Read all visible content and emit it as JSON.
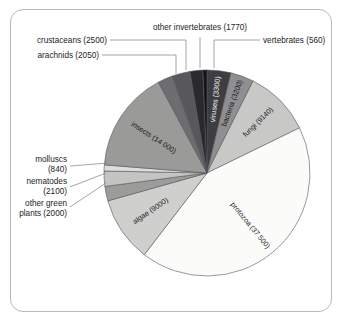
{
  "figure": {
    "frame_border_color": "#b9b9b9",
    "background_color": "#ffffff"
  },
  "chart_data": {
    "type": "pie",
    "title": "",
    "units": "number of described species",
    "total": 87960,
    "center": {
      "x": 207,
      "y": 173
    },
    "radius": 103,
    "start_angle_deg": -90,
    "direction": "clockwise",
    "legend": "none",
    "labels": [
      "viruses (3300)",
      "bacteria (3200)",
      "fungi (9140)",
      "protozoa (37 500)",
      "algae (9000)",
      "other green plants (2000)",
      "nematodes (2100)",
      "molluscs (840)",
      "insects (14 000)",
      "arachnids (2050)",
      "crustaceans (2500)",
      "other invertebrates (1770)",
      "vertebrates (560)"
    ],
    "categories": [
      "viruses",
      "bacteria",
      "fungi",
      "protozoa",
      "algae",
      "other green plants",
      "nematodes",
      "molluscs",
      "insects",
      "arachnids",
      "crustaceans",
      "other invertebrates",
      "vertebrates"
    ],
    "values": [
      3300,
      3200,
      9140,
      37500,
      9000,
      2000,
      2100,
      840,
      14000,
      2050,
      2500,
      1770,
      560
    ],
    "colors": [
      "#3e3e42",
      "#8f8f92",
      "#c8c8c6",
      "#fbfbf9",
      "#cfcfcd",
      "#9c9c9b",
      "#c4c4c2",
      "#dcdcda",
      "#9a9a99",
      "#6d6d70",
      "#58585c",
      "#2a2a2e",
      "#141416"
    ],
    "label_placement": [
      "inside",
      "inside",
      "inside",
      "inside",
      "inside",
      "callout-left",
      "callout-left",
      "callout-left",
      "inside",
      "callout-topleft",
      "callout-topleft",
      "callout-top",
      "callout-topright"
    ]
  },
  "callouts": {
    "other_invertebrates": "other invertebrates (1770)",
    "vertebrates": "vertebrates (560)",
    "crustaceans": "crustaceans (2500)",
    "arachnids": "arachnids (2050)",
    "molluscs_line1": "molluscs",
    "molluscs_line2": "(840)",
    "nematodes_line1": "nematodes",
    "nematodes_line2": "(2100)",
    "other_green_plants_line1": "other green",
    "other_green_plants_line2": "plants (2000)"
  },
  "inner_labels": {
    "viruses": "viruses (3300)",
    "bacteria": "bacteria (3200)",
    "fungi": "fungi (9140)",
    "protozoa": "protozoa (37 500)",
    "algae": "algae (9000)",
    "insects": "insects (14 000)"
  }
}
